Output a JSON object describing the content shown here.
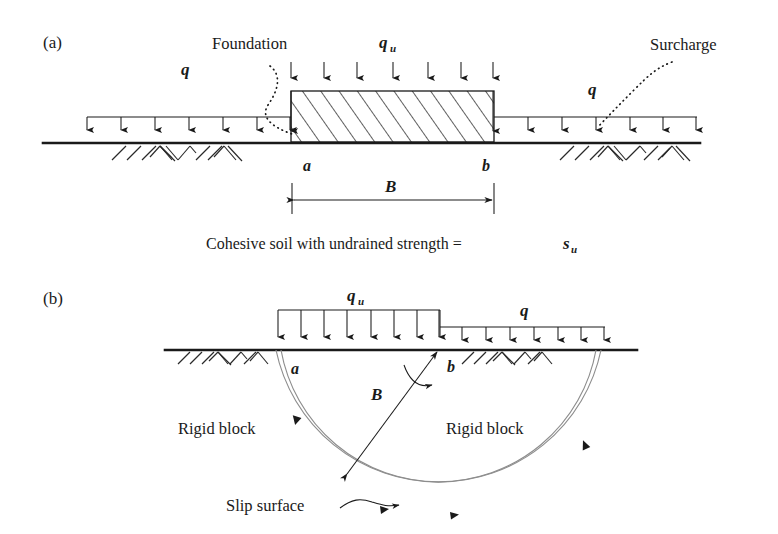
{
  "figure": {
    "panel_a": {
      "tag": "(a)",
      "labels": {
        "foundation": "Foundation",
        "surcharge": "Surcharge",
        "bearing_pressure": "q",
        "bearing_pressure_sub": "u",
        "surcharge_load_left": "q",
        "surcharge_load_right": "q",
        "point_a": "a",
        "point_b": "b",
        "width_dim": "B"
      },
      "caption": {
        "text_main": "Cohesive soil with undrained strength = ",
        "symbol": "s",
        "symbol_sub": "u"
      }
    },
    "panel_b": {
      "tag": "(b)",
      "labels": {
        "bearing_pressure": "q",
        "bearing_pressure_sub": "u",
        "surcharge_load": "q",
        "point_a": "a",
        "point_b": "b",
        "width_dim": "B",
        "rigid_block_left": "Rigid block",
        "rigid_block_right": "Rigid block",
        "slip_surface": "Slip surface"
      }
    }
  },
  "colors": {
    "ink": "#1a1a1a",
    "slip_surface": "#8d8d8d",
    "background": "#ffffff"
  }
}
